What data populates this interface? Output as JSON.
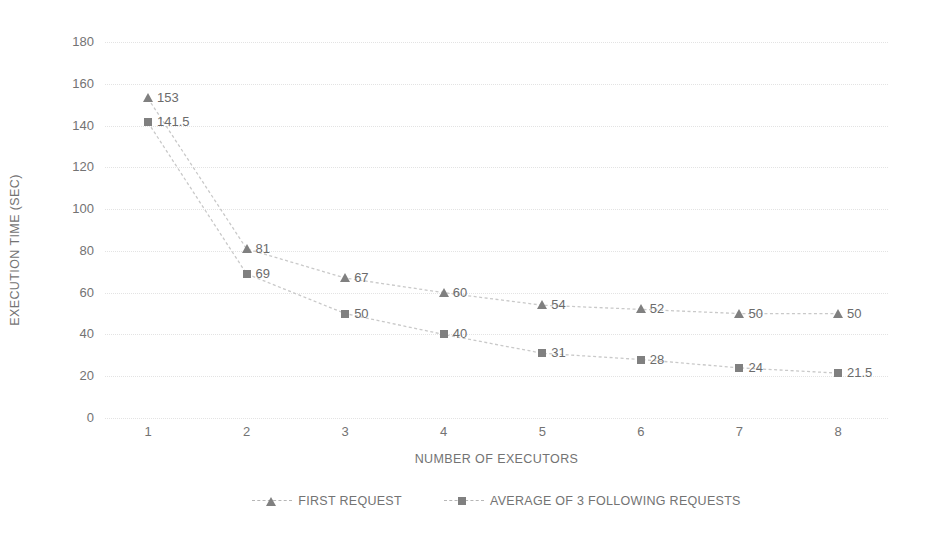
{
  "chart_data": {
    "type": "line",
    "title": "",
    "xlabel": "NUMBER OF EXECUTORS",
    "ylabel": "EXECUTION TIME (SEC)",
    "categories": [
      "1",
      "2",
      "3",
      "4",
      "5",
      "6",
      "7",
      "8"
    ],
    "x": [
      1,
      2,
      3,
      4,
      5,
      6,
      7,
      8
    ],
    "ylim": [
      0,
      180
    ],
    "ytick_labels": [
      "0",
      "20",
      "40",
      "60",
      "80",
      "100",
      "120",
      "140",
      "160",
      "180"
    ],
    "yticks": [
      0,
      20,
      40,
      60,
      80,
      100,
      120,
      140,
      160,
      180
    ],
    "grid": true,
    "legend_position": "bottom-center",
    "series": [
      {
        "name": "FIRST REQUEST",
        "marker": "triangle",
        "color": "#808080",
        "values": [
          153,
          81,
          67,
          60,
          54,
          52,
          50,
          50
        ],
        "labels": [
          "153",
          "81",
          "67",
          "60",
          "54",
          "52",
          "50",
          "50"
        ]
      },
      {
        "name": "AVERAGE OF 3 FOLLOWING REQUESTS",
        "marker": "square",
        "color": "#808080",
        "values": [
          141.5,
          69,
          50,
          40,
          31,
          28,
          24,
          21.5
        ],
        "labels": [
          "141.5",
          "69",
          "50",
          "40",
          "31",
          "28",
          "24",
          "21.5"
        ]
      }
    ]
  },
  "style": {
    "marker_color": "#808080",
    "gridline_color": "#e3e3e3",
    "text_color": "#737373",
    "background": "#ffffff"
  }
}
